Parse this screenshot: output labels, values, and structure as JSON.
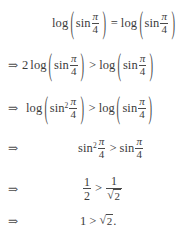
{
  "document": {
    "type": "math-derivation",
    "background_color": "#ffffff",
    "text_color": "#3b3b3b",
    "lines": [
      {
        "id": "line-1",
        "connector": "",
        "text": "log ( sin π/4 ) = log ( sin π/4 )",
        "parts": {
          "lead": "",
          "log_left": "log",
          "paren_open": "(",
          "sin_left": "sin",
          "sup_left": "",
          "num_left": "π",
          "den_left": "4",
          "paren_close": ")",
          "relation": "=",
          "log_right": "log",
          "sin_right": "sin",
          "num_right": "π",
          "den_right": "4"
        }
      },
      {
        "id": "line-2",
        "connector": "⇒",
        "text": "⇒ 2 log ( sin π/4 ) > log ( sin π/4 )",
        "parts": {
          "lead": "2",
          "log_left": "log",
          "paren_open": "(",
          "sin_left": "sin",
          "sup_left": "",
          "num_left": "π",
          "den_left": "4",
          "paren_close": ")",
          "relation": ">",
          "log_right": "log",
          "sin_right": "sin",
          "num_right": "π",
          "den_right": "4"
        }
      },
      {
        "id": "line-3",
        "connector": "⇒",
        "text": "⇒ log ( sin² π/4 ) > log ( sin π/4 )",
        "parts": {
          "lead": "",
          "log_left": "log",
          "paren_open": "(",
          "sin_left": "sin",
          "sup_left": "2",
          "num_left": "π",
          "den_left": "4",
          "paren_close": ")",
          "relation": ">",
          "log_right": "log",
          "sin_right": "sin",
          "num_right": "π",
          "den_right": "4"
        }
      },
      {
        "id": "line-4",
        "connector": "⇒",
        "text": "sin² π/4 > sin π/4",
        "parts": {
          "sin_left": "sin",
          "sup_left": "2",
          "num_left": "π",
          "den_left": "4",
          "relation": ">",
          "sin_right": "sin",
          "num_right": "π",
          "den_right": "4"
        }
      },
      {
        "id": "line-5",
        "connector": "⇒",
        "text": "1/2 > 1/√2",
        "parts": {
          "num_left": "1",
          "den_left": "2",
          "relation": ">",
          "num_right": "1",
          "radical": "√",
          "radicand": "2"
        }
      },
      {
        "id": "line-6",
        "connector": "⇒",
        "text": "1 > √2.",
        "parts": {
          "lhs": "1",
          "relation": ">",
          "radical": "√",
          "radicand": "2",
          "period": "."
        }
      }
    ]
  }
}
